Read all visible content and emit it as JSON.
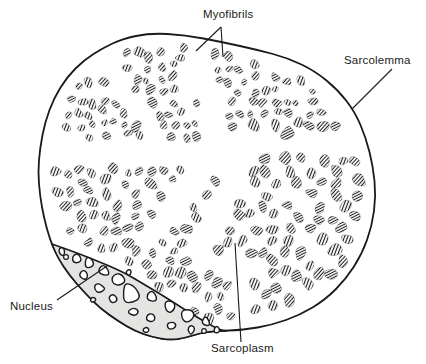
{
  "figure": {
    "labels": {
      "myofibrils": "Myofibrils",
      "sarcolemma": "Sarcolemma",
      "nucleus": "Nucleus",
      "sarcoplasm": "Sarcoplasm"
    },
    "colors": {
      "ink": "#1a1a1a",
      "background": "#ffffff",
      "nucleus_fill": "#e4e4e2"
    }
  }
}
